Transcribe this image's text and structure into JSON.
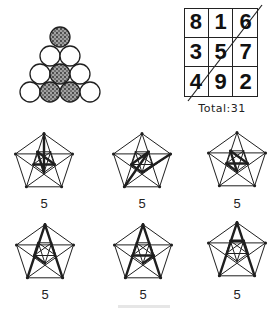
{
  "coin_triangle": {
    "circle_radius": 10,
    "circles": [
      {
        "cx": 60,
        "cy": 37,
        "shaded": true
      },
      {
        "cx": 50,
        "cy": 56,
        "shaded": false
      },
      {
        "cx": 70,
        "cy": 56,
        "shaded": false
      },
      {
        "cx": 40,
        "cy": 74,
        "shaded": false
      },
      {
        "cx": 60,
        "cy": 74,
        "shaded": true
      },
      {
        "cx": 80,
        "cy": 74,
        "shaded": false
      },
      {
        "cx": 30,
        "cy": 92,
        "shaded": false
      },
      {
        "cx": 50,
        "cy": 92,
        "shaded": true
      },
      {
        "cx": 70,
        "cy": 92,
        "shaded": true
      },
      {
        "cx": 90,
        "cy": 92,
        "shaded": false
      }
    ]
  },
  "magic_square": {
    "cells": [
      [
        "8",
        "1",
        "6"
      ],
      [
        "3",
        "5",
        "7"
      ],
      [
        "4",
        "9",
        "2"
      ]
    ],
    "diagonal_line": {
      "x1": 262,
      "y1": 5,
      "x2": 188,
      "y2": 101
    },
    "total_label": "Total:31"
  },
  "pentagons": [
    {
      "cx": 44,
      "cy": 163,
      "r": 30,
      "label": "5",
      "label_y": 197,
      "highlight": [
        [
          0,
          5
        ],
        [
          5,
          7
        ],
        [
          7,
          9
        ],
        [
          9,
          6
        ]
      ]
    },
    {
      "cx": 142,
      "cy": 163,
      "r": 30,
      "label": "5",
      "label_y": 197,
      "highlight": [
        [
          1,
          5
        ],
        [
          5,
          6
        ],
        [
          6,
          8
        ],
        [
          8,
          3
        ]
      ]
    },
    {
      "cx": 237,
      "cy": 162,
      "r": 30,
      "label": "5",
      "label_y": 197,
      "highlight": [
        [
          5,
          6
        ],
        [
          6,
          9
        ],
        [
          9,
          7
        ],
        [
          7,
          5
        ]
      ]
    },
    {
      "cx": 45,
      "cy": 254,
      "r": 30,
      "label": "5",
      "label_y": 288,
      "highlight": [
        [
          0,
          2
        ],
        [
          0,
          3
        ],
        [
          5,
          6
        ],
        [
          6,
          7
        ]
      ]
    },
    {
      "cx": 143,
      "cy": 254,
      "r": 30,
      "label": "5",
      "label_y": 288,
      "highlight": [
        [
          0,
          2
        ],
        [
          0,
          3
        ],
        [
          6,
          9
        ],
        [
          9,
          5
        ]
      ]
    },
    {
      "cx": 237,
      "cy": 252,
      "r": 30,
      "label": "5",
      "label_y": 288,
      "highlight": [
        [
          0,
          2
        ],
        [
          0,
          3
        ],
        [
          7,
          8
        ],
        [
          8,
          9
        ]
      ]
    }
  ],
  "colors": {
    "ink": "#1f1f1f",
    "shade": "#555555",
    "background": "#ffffff"
  }
}
